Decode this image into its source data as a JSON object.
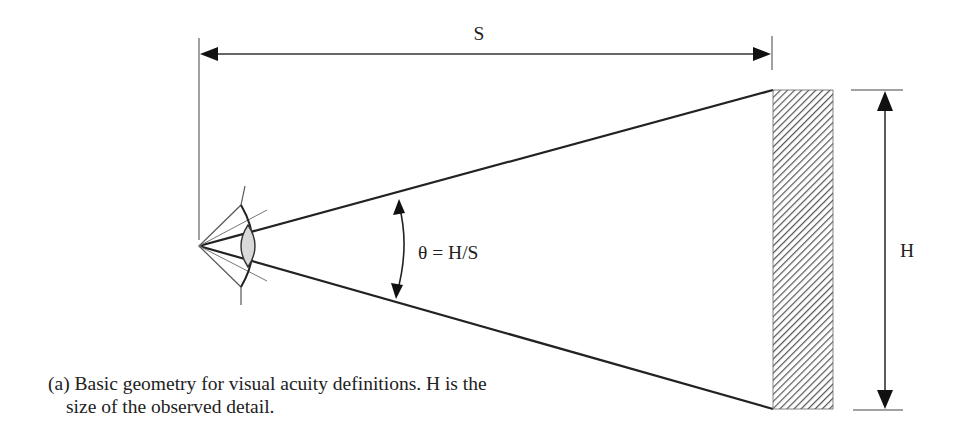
{
  "diagram": {
    "dimension_top_label": "S",
    "dimension_right_label": "H",
    "angle_label": "θ = H/S",
    "caption": "(a) Basic geometry for visual acuity definitions. H is the size of the observed detail.",
    "elements": {
      "eye": "eye-icon at apex (left)",
      "object": "hatched rectangle (observed detail) at right",
      "lines": "two sight lines from eye to top and bottom of object"
    },
    "colors": {
      "line": "#222222",
      "hatch": "#555555",
      "lens_fill": "#d9d9d9"
    }
  }
}
